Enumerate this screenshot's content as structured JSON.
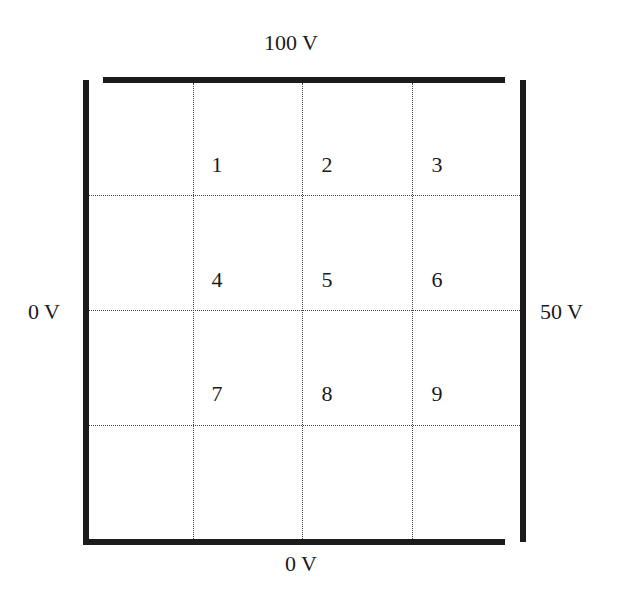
{
  "plates": {
    "top": {
      "label": "100 V"
    },
    "left": {
      "label": "0 V"
    },
    "right": {
      "label": "50 V"
    },
    "bottom": {
      "label": "0 V"
    }
  },
  "grid": {
    "columns": 4,
    "rows": 4,
    "points": [
      {
        "label": "1"
      },
      {
        "label": "2"
      },
      {
        "label": "3"
      },
      {
        "label": "4"
      },
      {
        "label": "5"
      },
      {
        "label": "6"
      },
      {
        "label": "7"
      },
      {
        "label": "8"
      },
      {
        "label": "9"
      }
    ]
  },
  "colors": {
    "plate": "#1c1c1c",
    "gridline": "#444444",
    "text": "#1a1a1a"
  }
}
